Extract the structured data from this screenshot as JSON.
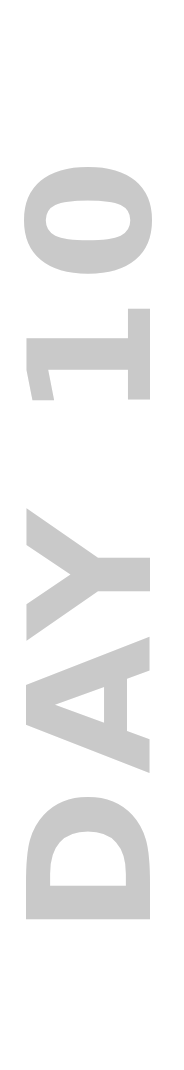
{
  "title": {
    "text": "DAY 10",
    "color": "#c9c9c9",
    "background": "#ffffff",
    "orientation": "rotated-vertical-bottom-to-top"
  }
}
